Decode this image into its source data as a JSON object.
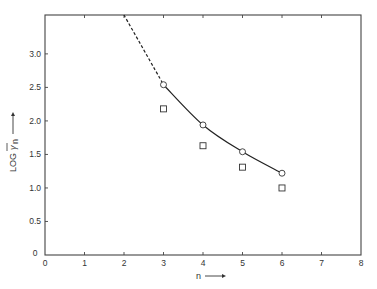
{
  "chart_data": {
    "type": "line",
    "title": "",
    "xlabel": "n",
    "ylabel": "LOG γ̄n",
    "xlim": [
      0,
      8
    ],
    "ylim": [
      0,
      3.58
    ],
    "x_ticks": [
      "0",
      "1",
      "2",
      "3",
      "4",
      "5",
      "6",
      "7",
      "8"
    ],
    "y_ticks": [
      "0",
      "0.5",
      "1.0",
      "1.5",
      "2.0",
      "2.5",
      "3.0"
    ],
    "grid": false,
    "legend": null,
    "series": [
      {
        "name": "circles (fitted curve)",
        "marker": "circle",
        "line": "solid",
        "x": [
          3,
          4,
          5,
          6
        ],
        "y": [
          2.54,
          1.94,
          1.54,
          1.22
        ]
      },
      {
        "name": "squares",
        "marker": "square",
        "line": "none",
        "x": [
          3,
          4,
          5,
          6
        ],
        "y": [
          2.18,
          1.63,
          1.31,
          1.0
        ]
      },
      {
        "name": "extrapolation",
        "marker": "none",
        "line": "dashed",
        "x": [
          2.0,
          3
        ],
        "y": [
          3.58,
          2.54
        ]
      }
    ]
  },
  "axes": {
    "x_label": "n",
    "y_label_prefix": "LOG",
    "y_label_symbol": "γ",
    "y_label_sub": "n",
    "origin_label": "0"
  }
}
